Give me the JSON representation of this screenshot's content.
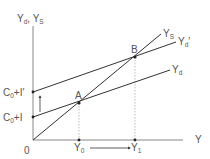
{
  "diagram": {
    "type": "keynesian-cross",
    "y_axis_label": {
      "main": "Y",
      "sub1": "d",
      "sep": ", Y",
      "sub2": "S"
    },
    "x_axis_label": "Y",
    "origin_label": "0",
    "intercepts": [
      {
        "main": "C",
        "sub": "0",
        "rest": "+I"
      },
      {
        "main": "C",
        "sub": "0",
        "rest": "+I′"
      }
    ],
    "lines": [
      {
        "name": "Ys",
        "main": "Y",
        "sub": "S"
      },
      {
        "name": "Yd_prime",
        "main": "Y",
        "sub": "d",
        "prime": "′"
      },
      {
        "name": "Yd",
        "main": "Y",
        "sub": "d"
      }
    ],
    "points": [
      {
        "label": "A"
      },
      {
        "label": "B"
      }
    ],
    "x_ticks": [
      {
        "main": "Y",
        "sub": "0"
      },
      {
        "main": "Y",
        "sub": "1"
      }
    ],
    "colors": {
      "line": "#333333",
      "axis": "#888888",
      "text": "#555555",
      "dotted": "#aaaaaa"
    }
  }
}
